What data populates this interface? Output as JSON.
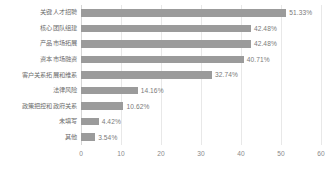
{
  "chart_data": {
    "type": "bar",
    "orientation": "horizontal",
    "title": "",
    "subtitle": "",
    "xlabel": "",
    "ylabel": "",
    "xlim": [
      0,
      60
    ],
    "xticks": [
      "0",
      "10",
      "20",
      "30",
      "40",
      "50",
      "60"
    ],
    "xtick_values": [
      0,
      10,
      20,
      30,
      40,
      50,
      60
    ],
    "grid": true,
    "grid_axis": "x",
    "legend": false,
    "value_suffix": "%",
    "bar_color": "#9b9b9b",
    "grid_color": "#e8e8e8",
    "label_color": "#6b6b6b",
    "value_color": "#7a7a7a",
    "tick_color": "#8a8a8a",
    "categories": [
      "关键人才招聘",
      "核心团队组建",
      "产品市场拓展",
      "资本市场融资",
      "客户关系拓展和维系",
      "法律风险",
      "政策把控和政府关系",
      "未填写",
      "其他"
    ],
    "values": [
      51.33,
      42.48,
      42.48,
      40.71,
      32.74,
      14.16,
      10.62,
      4.42,
      3.54
    ],
    "value_labels": [
      "51.33%",
      "42.48%",
      "42.48%",
      "40.71%",
      "32.74%",
      "14.16%",
      "10.62%",
      "4.42%",
      "3.54%"
    ]
  },
  "footer": {
    "clipped_text": ""
  }
}
